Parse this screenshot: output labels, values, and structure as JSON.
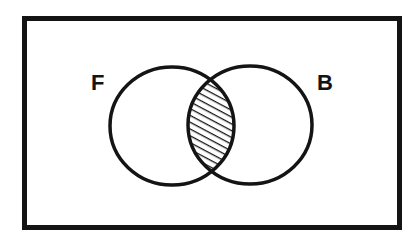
{
  "diagram": {
    "type": "venn",
    "universe": {
      "shape": "rectangle",
      "x": 24.5,
      "y": 18.5,
      "width": 375,
      "height": 209,
      "stroke_width": 5
    },
    "sets": [
      {
        "label": "F",
        "cx": 172,
        "cy": 126,
        "rx": 62,
        "ry": 59,
        "label_x": 91,
        "label_y": 90
      },
      {
        "label": "B",
        "cx": 250,
        "cy": 125,
        "rx": 62,
        "ry": 59,
        "label_x": 317,
        "label_y": 90
      }
    ],
    "shaded_region": "F ∩ B",
    "hatch": {
      "direction": "down-right",
      "spacing": 5
    },
    "colors": {
      "ink": "#141414",
      "background": "#ffffff"
    }
  }
}
